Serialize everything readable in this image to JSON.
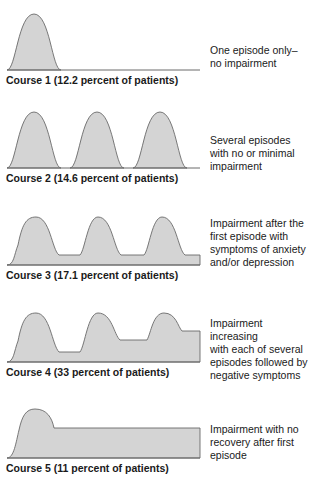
{
  "courses": [
    {
      "label": "Course 1 (12.2 percent of patients)",
      "description_lines": [
        "One episode only–",
        "no impairment"
      ]
    },
    {
      "label": "Course 2 (14.6 percent of patients)",
      "description_lines": [
        "Several episodes",
        "with no or minimal",
        "impairment"
      ]
    },
    {
      "label": "Course 3 (17.1 percent of patients)",
      "description_lines": [
        "Impairment after the",
        "first episode with",
        "symptoms of anxiety",
        "and/or depression"
      ]
    },
    {
      "label": "Course 4 (33 percent of patients)",
      "description_lines": [
        "Impairment increasing",
        "with each of several",
        "episodes followed by",
        "negative symptoms"
      ]
    },
    {
      "label": "Course 5 (11 percent of patients)",
      "description_lines": [
        "Impairment with no",
        "recovery after first",
        "episode"
      ]
    }
  ],
  "colors": {
    "fill": "#d4d4d4",
    "stroke": "#6a6a6a",
    "text": "#1a1a1a"
  }
}
